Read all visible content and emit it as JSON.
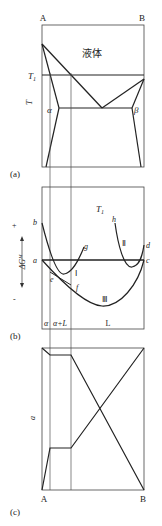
{
  "figure": {
    "panel_a": {
      "caption": "(a)",
      "component_left": "A",
      "component_right": "B",
      "region_label": "液体",
      "y_axis_label": "T",
      "isotherm_label": "T",
      "isotherm_subscript": "1",
      "phase_left": "α",
      "phase_right": "β"
    },
    "panel_b": {
      "caption": "(b)",
      "y_axis_label": "ΔG",
      "y_axis_superscript": "M",
      "plus_sign": "+",
      "minus_sign": "-",
      "temperature_label": "T",
      "temperature_subscript": "1",
      "point_labels": {
        "a": "a",
        "b": "b",
        "c": "c",
        "d": "d",
        "e": "e",
        "f": "f",
        "g": "g",
        "h": "h"
      },
      "curve_labels": {
        "I": "Ⅰ",
        "II": "Ⅱ",
        "III": "Ⅲ"
      },
      "region_labels": [
        "α",
        "α+L",
        "L"
      ]
    },
    "panel_c": {
      "caption": "(c)",
      "y_axis_label": "a",
      "component_left": "A",
      "component_right": "B"
    },
    "colors": {
      "line": "#222222",
      "thin_line": "#555555",
      "background": "#ffffff"
    }
  }
}
